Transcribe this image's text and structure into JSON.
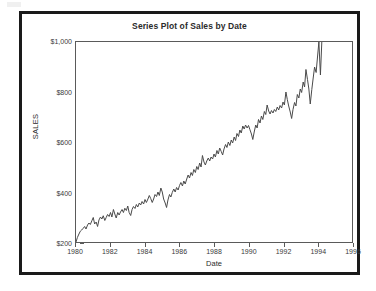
{
  "chart_data": {
    "type": "line",
    "title": "Series Plot of Sales by Date",
    "xlabel": "Date",
    "ylabel": "SALES",
    "xlim": [
      1980,
      1996
    ],
    "ylim": [
      200,
      1000
    ],
    "grid": false,
    "legend": null,
    "x_ticks": [
      "1980",
      "1982",
      "1984",
      "1986",
      "1988",
      "1990",
      "1992",
      "1994",
      "1996"
    ],
    "x_tick_values": [
      1980,
      1982,
      1984,
      1986,
      1988,
      1990,
      1992,
      1994,
      1996
    ],
    "y_ticks": [
      "$200",
      "$400",
      "$600",
      "$800",
      "$1,000"
    ],
    "y_tick_values": [
      200,
      400,
      600,
      800,
      1000
    ],
    "line_color": "#4a4a4a",
    "line_width": 1,
    "series": [
      {
        "name": "SALES",
        "x": [
          1980.0,
          1980.08,
          1980.17,
          1980.25,
          1980.33,
          1980.42,
          1980.5,
          1980.58,
          1980.67,
          1980.75,
          1980.83,
          1980.92,
          1981.0,
          1981.08,
          1981.17,
          1981.25,
          1981.33,
          1981.42,
          1981.5,
          1981.58,
          1981.67,
          1981.75,
          1981.83,
          1981.92,
          1982.0,
          1982.08,
          1982.17,
          1982.25,
          1982.33,
          1982.42,
          1982.5,
          1982.58,
          1982.67,
          1982.75,
          1982.83,
          1982.92,
          1983.0,
          1983.08,
          1983.17,
          1983.25,
          1983.33,
          1983.42,
          1983.5,
          1983.58,
          1983.67,
          1983.75,
          1983.83,
          1983.92,
          1984.0,
          1984.08,
          1984.17,
          1984.25,
          1984.33,
          1984.42,
          1984.5,
          1984.58,
          1984.67,
          1984.75,
          1984.83,
          1984.92,
          1985.0,
          1985.08,
          1985.17,
          1985.25,
          1985.33,
          1985.42,
          1985.5,
          1985.58,
          1985.67,
          1985.75,
          1985.83,
          1985.92,
          1986.0,
          1986.08,
          1986.17,
          1986.25,
          1986.33,
          1986.42,
          1986.5,
          1986.58,
          1986.67,
          1986.75,
          1986.83,
          1986.92,
          1987.0,
          1987.08,
          1987.17,
          1987.25,
          1987.33,
          1987.42,
          1987.5,
          1987.58,
          1987.67,
          1987.75,
          1987.83,
          1987.92,
          1988.0,
          1988.08,
          1988.17,
          1988.25,
          1988.33,
          1988.42,
          1988.5,
          1988.58,
          1988.67,
          1988.75,
          1988.83,
          1988.92,
          1989.0,
          1989.08,
          1989.17,
          1989.25,
          1989.33,
          1989.42,
          1989.5,
          1989.58,
          1989.67,
          1989.75,
          1989.83,
          1989.92,
          1990.0,
          1990.08,
          1990.17,
          1990.25,
          1990.33,
          1990.42,
          1990.5,
          1990.58,
          1990.67,
          1990.75,
          1990.83,
          1990.92,
          1991.0,
          1991.08,
          1991.17,
          1991.25,
          1991.33,
          1991.42,
          1991.5,
          1991.58,
          1991.67,
          1991.75,
          1991.83,
          1991.92,
          1992.0,
          1992.08,
          1992.17,
          1992.25,
          1992.33,
          1992.42,
          1992.5,
          1992.58,
          1992.67,
          1992.75,
          1992.83,
          1992.92,
          1993.0,
          1993.08,
          1993.17,
          1993.25,
          1993.33,
          1993.42,
          1993.5,
          1993.58,
          1993.67,
          1993.75,
          1993.83,
          1993.92,
          1994.0,
          1994.08,
          1994.17,
          1994.25
        ],
        "values": [
          200,
          218,
          232,
          243,
          248,
          255,
          262,
          252,
          268,
          276,
          270,
          285,
          298,
          272,
          280,
          262,
          288,
          300,
          292,
          305,
          286,
          298,
          310,
          302,
          318,
          300,
          330,
          312,
          296,
          318,
          308,
          320,
          330,
          318,
          335,
          326,
          344,
          318,
          306,
          330,
          342,
          334,
          350,
          340,
          356,
          348,
          362,
          352,
          370,
          358,
          372,
          386,
          374,
          358,
          372,
          390,
          382,
          400,
          386,
          416,
          400,
          372,
          356,
          338,
          368,
          390,
          380,
          398,
          412,
          400,
          418,
          408,
          426,
          438,
          424,
          444,
          432,
          452,
          468,
          456,
          478,
          466,
          490,
          478,
          502,
          490,
          516,
          500,
          546,
          520,
          508,
          524,
          536,
          524,
          540,
          532,
          552,
          540,
          566,
          552,
          576,
          562,
          548,
          572,
          590,
          578,
          600,
          586,
          608,
          596,
          620,
          606,
          634,
          622,
          648,
          636,
          664,
          652,
          668,
          656,
          666,
          650,
          632,
          610,
          640,
          668,
          656,
          690,
          676,
          704,
          690,
          722,
          710,
          748,
          724,
          712,
          726,
          716,
          730,
          722,
          740,
          728,
          746,
          736,
          760,
          748,
          800,
          770,
          744,
          720,
          694,
          730,
          758,
          744,
          790,
          776,
          812,
          798,
          840,
          820,
          890,
          850,
          812,
          752,
          810,
          856,
          900,
          878,
          940,
          1000,
          868,
          1000
        ]
      }
    ]
  },
  "figure": {
    "title": "Series Plot of Sales by Date",
    "x_axis_title": "Date",
    "y_axis_title": "SALES"
  }
}
